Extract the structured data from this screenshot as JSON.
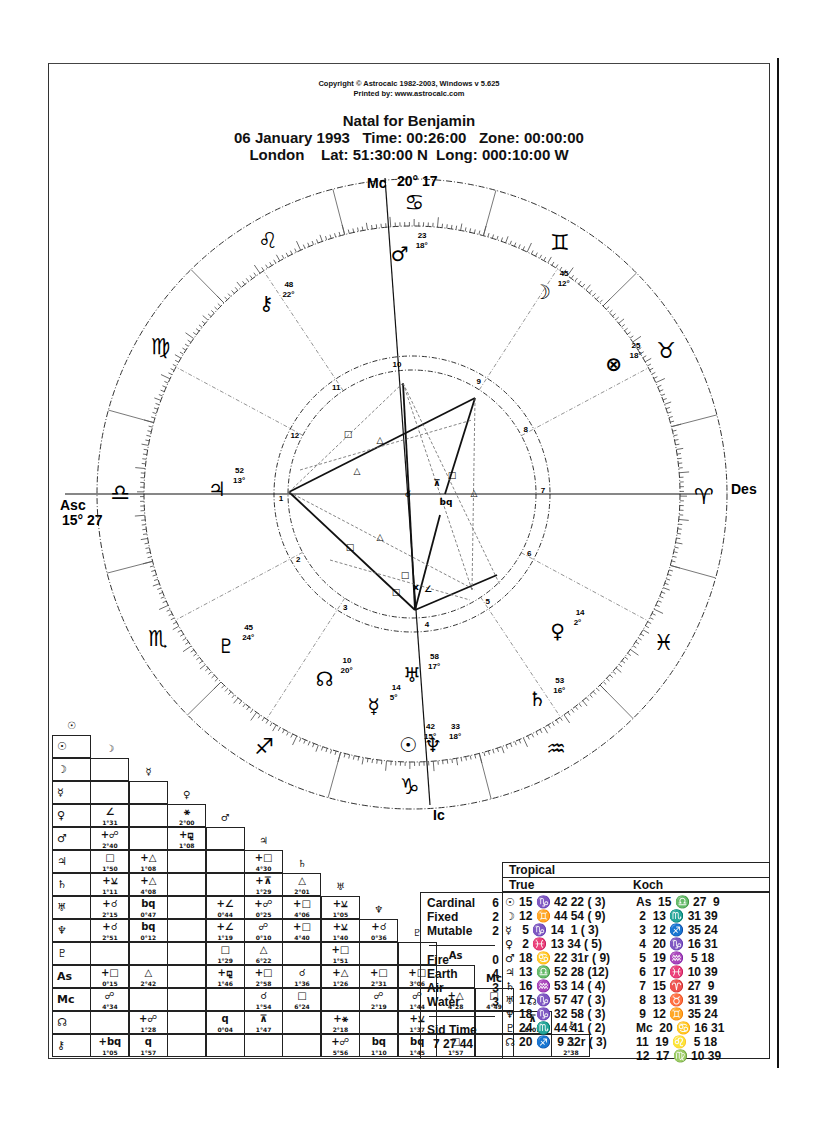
{
  "header": {
    "copyright": "Copyright © Astrocalc 1982-2003, Windows v 5.625",
    "printed_by": "Printed by: www.astrocalc.com",
    "title": "Natal for Benjamin",
    "line2": "06 January 1993   Time: 00:26:00   Zone: 00:00:00",
    "line3": "London    Lat: 51:30:00 N  Long: 000:10:00 W"
  },
  "wheel": {
    "axes": {
      "mc_label": "Mc",
      "mc_degree": "20° 17",
      "ic_label": "Ic",
      "asc_label": "Asc",
      "asc_degree": "15° 27",
      "des_label": "Des"
    },
    "signs": [
      {
        "name": "aries",
        "glyph": "♈"
      },
      {
        "name": "taurus",
        "glyph": "♉"
      },
      {
        "name": "gemini",
        "glyph": "♊"
      },
      {
        "name": "cancer",
        "glyph": "♋"
      },
      {
        "name": "leo",
        "glyph": "♌"
      },
      {
        "name": "virgo",
        "glyph": "♍"
      },
      {
        "name": "libra",
        "glyph": "♎"
      },
      {
        "name": "scorpio",
        "glyph": "♏"
      },
      {
        "name": "sagittarius",
        "glyph": "♐"
      },
      {
        "name": "capricorn",
        "glyph": "♑"
      },
      {
        "name": "aquarius",
        "glyph": "♒"
      },
      {
        "name": "pisces",
        "glyph": "♓"
      }
    ],
    "house_numbers": [
      "1",
      "2",
      "3",
      "4",
      "5",
      "6",
      "7",
      "8",
      "9",
      "10",
      "11",
      "12"
    ],
    "planets": [
      {
        "name": "mars",
        "glyph": "♂",
        "deg": "18°",
        "min": "23"
      },
      {
        "name": "chiron",
        "glyph": "⚷",
        "deg": "22°",
        "min": "48"
      },
      {
        "name": "moon",
        "glyph": "☽",
        "deg": "12°",
        "min": "45"
      },
      {
        "name": "part-of-fortune",
        "glyph": "⊗",
        "deg": "18°",
        "min": "25"
      },
      {
        "name": "jupiter",
        "glyph": "♃",
        "deg": "13°",
        "min": "52"
      },
      {
        "name": "pluto",
        "glyph": "♇",
        "deg": "24°",
        "min": "45"
      },
      {
        "name": "north-node",
        "glyph": "☊",
        "deg": "20°",
        "min": "10"
      },
      {
        "name": "mercury",
        "glyph": "☿",
        "deg": "5°",
        "min": "14"
      },
      {
        "name": "sun",
        "glyph": "☉",
        "deg": "15°",
        "min": "42"
      },
      {
        "name": "neptune",
        "glyph": "♆",
        "deg": "18°",
        "min": "33"
      },
      {
        "name": "uranus",
        "glyph": "♅",
        "deg": "17°",
        "min": "58"
      },
      {
        "name": "saturn",
        "glyph": "♄",
        "deg": "16°",
        "min": "53"
      },
      {
        "name": "venus",
        "glyph": "♀",
        "deg": "2°",
        "min": "14"
      }
    ],
    "aspect_markers": [
      "□",
      "△",
      "△",
      "□",
      "□",
      "□",
      "△",
      "ⅹ",
      "∠",
      "bq",
      "⊼",
      "□",
      "△",
      "☌"
    ]
  },
  "aspect_grid": {
    "headers": [
      "☉",
      "☽",
      "☿",
      "♀",
      "♂",
      "♃",
      "♄",
      "♅",
      "♆",
      "♇",
      "As",
      "Mc",
      "☊",
      "⚷"
    ],
    "rows": [
      {
        "label": "☉",
        "cells": []
      },
      {
        "label": "☽",
        "cells": [
          [
            "",
            ""
          ]
        ]
      },
      {
        "label": "☿",
        "cells": [
          [
            "",
            ""
          ],
          [
            "",
            ""
          ]
        ]
      },
      {
        "label": "♀",
        "cells": [
          [
            "∠",
            "1°31"
          ],
          [
            "",
            ""
          ],
          [
            "⚹",
            "2°00"
          ]
        ]
      },
      {
        "label": "♂",
        "cells": [
          [
            "+☍",
            "2°40"
          ],
          [
            "",
            ""
          ],
          [
            "+⚼",
            "1°08"
          ],
          [
            "",
            ""
          ]
        ]
      },
      {
        "label": "♃",
        "cells": [
          [
            "□",
            "1°50"
          ],
          [
            "+△",
            "1°08"
          ],
          [
            "",
            ""
          ],
          [
            "",
            ""
          ],
          [
            "+□",
            "4°30"
          ]
        ]
      },
      {
        "label": "♄",
        "cells": [
          [
            "+⚺",
            "1°11"
          ],
          [
            "+△",
            "4°08"
          ],
          [
            "",
            ""
          ],
          [
            "",
            ""
          ],
          [
            "+⊼",
            "1°29"
          ],
          [
            "△",
            "2°01"
          ]
        ]
      },
      {
        "label": "♅",
        "cells": [
          [
            "+☌",
            "2°15"
          ],
          [
            "bq",
            "0°47"
          ],
          [
            "",
            ""
          ],
          [
            "+∠",
            "0°44"
          ],
          [
            "+☍",
            "0°25"
          ],
          [
            "+□",
            "4°06"
          ],
          [
            "+⚺",
            "1°05"
          ]
        ]
      },
      {
        "label": "♆",
        "cells": [
          [
            "+☌",
            "2°51"
          ],
          [
            "bq",
            "0°12"
          ],
          [
            "",
            ""
          ],
          [
            "+∠",
            "1°19"
          ],
          [
            "☍",
            "0°10"
          ],
          [
            "+□",
            "4°40"
          ],
          [
            "+⚺",
            "1°40"
          ],
          [
            "+☌",
            "0°36"
          ]
        ]
      },
      {
        "label": "♇",
        "cells": [
          [
            "",
            ""
          ],
          [
            "",
            ""
          ],
          [
            "",
            ""
          ],
          [
            "□",
            "1°29"
          ],
          [
            "△",
            "6°22"
          ],
          [
            "",
            ""
          ],
          [
            "+□",
            "1°51"
          ],
          [
            "",
            ""
          ],
          [
            "",
            ""
          ]
        ]
      },
      {
        "label": "As",
        "cells": [
          [
            "+□",
            "0°15"
          ],
          [
            "△",
            "2°42"
          ],
          [
            "",
            ""
          ],
          [
            "+⚼",
            "1°46"
          ],
          [
            "+□",
            "2°58"
          ],
          [
            "☌",
            "1°36"
          ],
          [
            "+△",
            "1°26"
          ],
          [
            "+□",
            "2°31"
          ],
          [
            "+□",
            "3°06"
          ],
          [
            "",
            ""
          ]
        ]
      },
      {
        "label": "Mc",
        "cells": [
          [
            "☍",
            "4°34"
          ],
          [
            "",
            ""
          ],
          [
            "",
            ""
          ],
          [
            "",
            ""
          ],
          [
            "☌",
            "1°54"
          ],
          [
            "□",
            "6°24"
          ],
          [
            "",
            ""
          ],
          [
            "☍",
            "2°19"
          ],
          [
            "☍",
            "1°44"
          ],
          [
            "+△",
            "4°28"
          ],
          [
            "□",
            "4°49"
          ]
        ]
      },
      {
        "label": "☊",
        "cells": [
          [
            "",
            ""
          ],
          [
            "+☍",
            "1°28"
          ],
          [
            "",
            ""
          ],
          [
            "q",
            "0°04"
          ],
          [
            "⊼",
            "1°47"
          ],
          [
            "",
            ""
          ],
          [
            "+⚹",
            "2°18"
          ],
          [
            "",
            ""
          ],
          [
            "+⚺",
            "1°37"
          ],
          [
            "",
            ""
          ],
          [
            "",
            ""
          ],
          [
            "⊼",
            "0°07"
          ]
        ]
      },
      {
        "label": "⚷",
        "cells": [
          [
            "+bq",
            "1°05"
          ],
          [
            "q",
            "1°57"
          ],
          [
            "",
            ""
          ],
          [
            "",
            ""
          ],
          [
            "",
            ""
          ],
          [
            "",
            ""
          ],
          [
            "+☍",
            "5°56"
          ],
          [
            "bq",
            "1°10"
          ],
          [
            "bq",
            "1°45"
          ],
          [
            "□",
            "1°57"
          ],
          [
            "",
            ""
          ],
          [
            "",
            ""
          ],
          [
            "△",
            "2°38"
          ]
        ]
      }
    ]
  },
  "summary_table": {
    "zodiac": "Tropical",
    "node_type": "True",
    "house_system": "Koch",
    "modes": [
      {
        "label": "Cardinal",
        "value": "6"
      },
      {
        "label": "Fixed",
        "value": "2"
      },
      {
        "label": "Mutable",
        "value": "2"
      }
    ],
    "elements": [
      {
        "label": "Fire",
        "value": "0"
      },
      {
        "label": "Earth",
        "value": "4"
      },
      {
        "label": "Air",
        "value": "3"
      },
      {
        "label": "Water",
        "value": "3"
      }
    ],
    "sid_time_label": "Sid Time",
    "sid_time_value": "7 27 44",
    "planets": [
      {
        "glyph": "☉",
        "pos": "15 ♑ 42 22",
        "house": "( 3)"
      },
      {
        "glyph": "☽",
        "pos": "12 ♊ 44 54",
        "house": "( 9)"
      },
      {
        "glyph": "☿",
        "pos": " 5 ♑ 14  1",
        "house": "( 3)"
      },
      {
        "glyph": "♀",
        "pos": " 2 ♓ 13 34",
        "house": "( 5)"
      },
      {
        "glyph": "♂",
        "pos": "18 ♋ 22 31r",
        "house": "( 9)"
      },
      {
        "glyph": "♃",
        "pos": "13 ♎ 52 28",
        "house": "(12)"
      },
      {
        "glyph": "♄",
        "pos": "16 ♒ 53 14",
        "house": "( 4)"
      },
      {
        "glyph": "♅",
        "pos": "17 ♑ 57 47",
        "house": "( 3)"
      },
      {
        "glyph": "♆",
        "pos": "18 ♑ 32 58",
        "house": "( 3)"
      },
      {
        "glyph": "♇",
        "pos": "24 ♏ 44 41",
        "house": "( 2)"
      },
      {
        "glyph": "☊",
        "pos": "20 ♐  9 32r",
        "house": "( 3)"
      }
    ],
    "cusps": [
      {
        "label": "As",
        "pos": "15 ♎ 27  9"
      },
      {
        "label": "2",
        "pos": "13 ♏ 31 39"
      },
      {
        "label": "3",
        "pos": "12 ♐ 35 24"
      },
      {
        "label": "4",
        "pos": "20 ♑ 16 31"
      },
      {
        "label": "5",
        "pos": "19 ♒  5 18"
      },
      {
        "label": "6",
        "pos": "17 ♓ 10 39"
      },
      {
        "label": "7",
        "pos": "15 ♈ 27  9"
      },
      {
        "label": "8",
        "pos": "13 ♉ 31 39"
      },
      {
        "label": "9",
        "pos": "12 ♊ 35 24"
      },
      {
        "label": "Mc",
        "pos": "20 ♋ 16 31"
      },
      {
        "label": "11",
        "pos": "19 ♌  5 18"
      },
      {
        "label": "12",
        "pos": "17 ♍ 10 39"
      }
    ]
  }
}
